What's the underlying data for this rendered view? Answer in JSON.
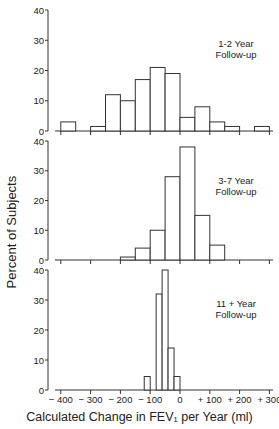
{
  "chart_data": [
    {
      "type": "bar",
      "panel_label": [
        "1-2 Year",
        "Follow-up"
      ],
      "bin_width": 50,
      "bins": [
        {
          "x0": -400,
          "x1": -350,
          "value": 3
        },
        {
          "x0": -300,
          "x1": -250,
          "value": 1.5
        },
        {
          "x0": -250,
          "x1": -200,
          "value": 12
        },
        {
          "x0": -200,
          "x1": -150,
          "value": 10
        },
        {
          "x0": -150,
          "x1": -100,
          "value": 17
        },
        {
          "x0": -100,
          "x1": -50,
          "value": 21
        },
        {
          "x0": -50,
          "x1": 0,
          "value": 19
        },
        {
          "x0": 0,
          "x1": 50,
          "value": 4.5
        },
        {
          "x0": 50,
          "x1": 100,
          "value": 8
        },
        {
          "x0": 100,
          "x1": 150,
          "value": 3
        },
        {
          "x0": 150,
          "x1": 200,
          "value": 1.5
        },
        {
          "x0": 250,
          "x1": 300,
          "value": 1.5
        }
      ],
      "ylim": [
        0,
        40
      ],
      "yticks": [
        "0",
        "10",
        "20",
        "30",
        "40"
      ]
    },
    {
      "type": "bar",
      "panel_label": [
        "3-7 Year",
        "Follow-up"
      ],
      "bin_width": 50,
      "bins": [
        {
          "x0": -200,
          "x1": -150,
          "value": 1
        },
        {
          "x0": -150,
          "x1": -100,
          "value": 4
        },
        {
          "x0": -100,
          "x1": -50,
          "value": 10
        },
        {
          "x0": -50,
          "x1": 0,
          "value": 28
        },
        {
          "x0": 0,
          "x1": 50,
          "value": 38
        },
        {
          "x0": 50,
          "x1": 100,
          "value": 15
        },
        {
          "x0": 100,
          "x1": 150,
          "value": 5
        }
      ],
      "ylim": [
        0,
        40
      ],
      "yticks": [
        "0",
        "10",
        "20",
        "30",
        "40"
      ]
    },
    {
      "type": "bar",
      "panel_label": [
        "11 +  Year",
        "Follow-up"
      ],
      "bin_width": 20,
      "bins": [
        {
          "x0": -120,
          "x1": -100,
          "value": 4.5
        },
        {
          "x0": -80,
          "x1": -60,
          "value": 32
        },
        {
          "x0": -60,
          "x1": -40,
          "value": 40
        },
        {
          "x0": -40,
          "x1": -20,
          "value": 14
        },
        {
          "x0": -20,
          "x1": 0,
          "value": 4.5
        }
      ],
      "ylim": [
        0,
        40
      ],
      "yticks": [
        "0",
        "10",
        "20",
        "30",
        "40"
      ]
    }
  ],
  "axes": {
    "xlabel": "Calculated Change in FEV₁ per Year  (ml)",
    "ylabel": "Percent of Subjects",
    "xticks": [
      "− 400",
      "− 300",
      "− 200",
      "− 100",
      "0",
      "+ 100",
      "+ 200",
      "+ 300"
    ],
    "xlim": [
      -440,
      310
    ]
  }
}
